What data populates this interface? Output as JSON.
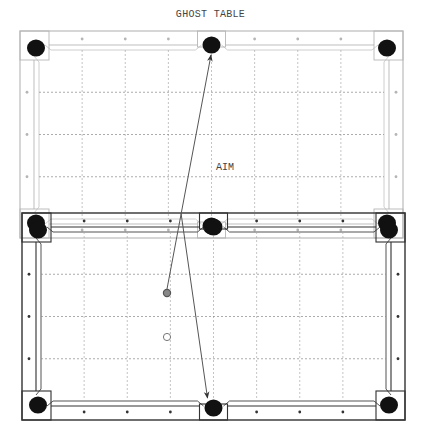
{
  "diagram": {
    "title": "GHOST TABLE",
    "aim_label": "AIM",
    "tables": [
      {
        "name": "ghost-table",
        "style": "light",
        "color": "#b5b5b5"
      },
      {
        "name": "real-table",
        "style": "dark",
        "color": "#333333"
      }
    ],
    "grid": {
      "columns": 8,
      "rows": 4,
      "line_style": "dotted"
    },
    "rail_diamonds": {
      "long_rail_per_half": 3,
      "short_rail": 3
    },
    "pockets": [
      "top-left",
      "top-middle",
      "top-right",
      "bottom-left",
      "bottom-middle",
      "bottom-right"
    ],
    "balls": [
      {
        "name": "object-ball",
        "fill": "#888888",
        "stroke": "#555555"
      },
      {
        "name": "cue-ball",
        "fill": "#ffffff",
        "stroke": "#777777"
      }
    ],
    "paths": [
      {
        "name": "aim-line-to-ghost-pocket",
        "from": "object-ball",
        "to": "ghost-table top-middle pocket",
        "arrow": true
      },
      {
        "name": "reflected-shot-line",
        "from": "real-table top rail",
        "to": "real-table bottom-middle pocket",
        "arrow": true
      }
    ],
    "colors": {
      "pocket": "#111111",
      "line": "#555555",
      "grid": "#999999"
    }
  }
}
